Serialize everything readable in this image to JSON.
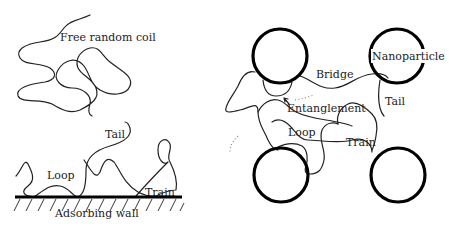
{
  "left_panel": {
    "free_coil_label": "Free random coil",
    "tail_label": "Tail",
    "loop_label": "Loop",
    "train_label": "Train",
    "wall_label": "Adsorbing wall"
  },
  "right_panel": {
    "nanoparticle_label": "Nanoparticle",
    "bridge_label": "Bridge",
    "tail_label": "Tail",
    "entanglement_label": "Entanglement",
    "loop_label": "Loop",
    "train_label": "Train"
  },
  "colors": {
    "chain": "#222222",
    "particle": "#000000",
    "background": "#ffffff"
  }
}
